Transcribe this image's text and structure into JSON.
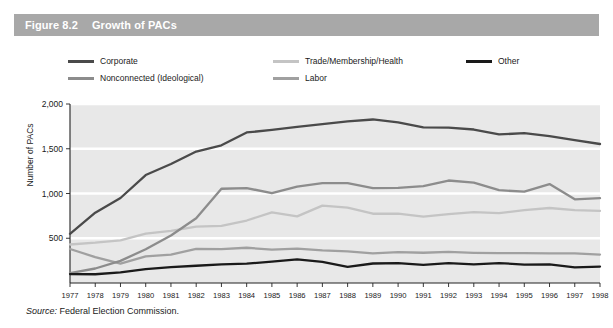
{
  "figure": {
    "number": "Figure 8.2",
    "title": "Growth of PACs"
  },
  "source": {
    "label": "Source:",
    "text": "Federal Election Commission."
  },
  "colors": {
    "header_bar": "#a8a8a8",
    "plot_background": "#e8e8e8",
    "gridline": "#ffffff",
    "axis": "#222222",
    "corporate": "#4a4a4a",
    "nonconnected": "#8c8c8c",
    "trade": "#c4c4c4",
    "labor": "#a0a0a0",
    "other": "#1a1a1a"
  },
  "legend": {
    "position": "top",
    "entries": [
      {
        "label": "Corporate",
        "color": "#4a4a4a"
      },
      {
        "label": "Nonconnected (Ideological)",
        "color": "#8c8c8c"
      },
      {
        "label": "Trade/Membership/Health",
        "color": "#c4c4c4"
      },
      {
        "label": "Labor",
        "color": "#a0a0a0"
      },
      {
        "label": "Other",
        "color": "#1a1a1a"
      }
    ]
  },
  "chart_data": {
    "type": "line",
    "title": "Growth of PACs",
    "xlabel": "",
    "ylabel": "Number of PACs",
    "xlim": [
      1977,
      1998
    ],
    "ylim": [
      0,
      2000
    ],
    "yticks": [
      0,
      500,
      1000,
      1500,
      2000
    ],
    "ytick_labels": [
      "",
      "500",
      "1,000",
      "1,500",
      "2,000"
    ],
    "grid": true,
    "legend_position": "top",
    "x": [
      1977,
      1978,
      1979,
      1980,
      1981,
      1982,
      1983,
      1984,
      1985,
      1986,
      1987,
      1988,
      1989,
      1990,
      1991,
      1992,
      1993,
      1994,
      1995,
      1996,
      1997,
      1998
    ],
    "categories": [
      "1977",
      "1978",
      "1979",
      "1980",
      "1981",
      "1982",
      "1983",
      "1984",
      "1985",
      "1986",
      "1987",
      "1988",
      "1989",
      "1990",
      "1991",
      "1992",
      "1993",
      "1994",
      "1995",
      "1996",
      "1997",
      "1998"
    ],
    "series": [
      {
        "name": "Corporate",
        "color": "#4a4a4a",
        "values": [
          550,
          785,
          950,
          1206,
          1329,
          1469,
          1538,
          1682,
          1710,
          1744,
          1775,
          1806,
          1827,
          1795,
          1738,
          1735,
          1715,
          1660,
          1674,
          1642,
          1597,
          1553
        ]
      },
      {
        "name": "Nonconnected (Ideological)",
        "color": "#8c8c8c",
        "values": [
          110,
          162,
          247,
          378,
          531,
          723,
          1053,
          1061,
          1003,
          1077,
          1115,
          1115,
          1060,
          1062,
          1083,
          1145,
          1121,
          1037,
          1020,
          1105,
          935,
          948
        ]
      },
      {
        "name": "Trade/Membership/Health",
        "color": "#c4c4c4",
        "values": [
          430,
          450,
          477,
          552,
          583,
          629,
          638,
          698,
          790,
          745,
          865,
          843,
          774,
          774,
          742,
          770,
          792,
          780,
          815,
          838,
          815,
          805
        ]
      },
      {
        "name": "Labor",
        "color": "#a0a0a0",
        "values": [
          380,
          290,
          217,
          297,
          318,
          380,
          378,
          394,
          372,
          384,
          364,
          354,
          331,
          346,
          338,
          347,
          337,
          333,
          334,
          332,
          332,
          318
        ]
      },
      {
        "name": "Other",
        "color": "#1a1a1a",
        "values": [
          100,
          98,
          118,
          156,
          177,
          193,
          208,
          216,
          238,
          263,
          235,
          181,
          218,
          222,
          202,
          223,
          209,
          223,
          206,
          207,
          175,
          184
        ]
      }
    ]
  }
}
